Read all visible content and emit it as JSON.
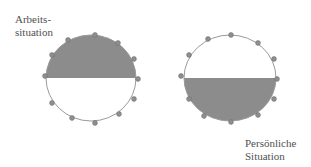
{
  "diagram": {
    "colors": {
      "background": "#ffffff",
      "fill": "#8c8c8c",
      "outline": "#9a9a9a",
      "dot_fill": "#8f8f8f",
      "dot_stroke": "#6e6e6e",
      "label": "#505050"
    },
    "circles": [
      {
        "id": "arbeitssituation",
        "label": "Arbeits-\nsituation",
        "filled_half": "top",
        "center": [
          91,
          78
        ],
        "rx": 45,
        "ry": 43,
        "dots": [
          [
            68,
            40
          ],
          [
            95,
            35
          ],
          [
            118,
            43
          ],
          [
            134,
            59
          ],
          [
            138,
            79
          ],
          [
            134,
            99
          ],
          [
            119,
            114
          ],
          [
            95,
            123
          ],
          [
            72,
            118
          ],
          [
            52,
            103
          ],
          [
            52,
            55
          ],
          [
            45,
            76
          ]
        ]
      },
      {
        "id": "persoenliche-situation",
        "label": "Persönliche\nSituation",
        "filled_half": "bottom",
        "center": [
          230,
          78
        ],
        "rx": 46,
        "ry": 43,
        "dots": [
          [
            208,
            39
          ],
          [
            231,
            35
          ],
          [
            258,
            43
          ],
          [
            274,
            59
          ],
          [
            277,
            79
          ],
          [
            274,
            99
          ],
          [
            258,
            115
          ],
          [
            231,
            122
          ],
          [
            204,
            116
          ],
          [
            189,
            99
          ],
          [
            189,
            55
          ],
          [
            181,
            76
          ]
        ]
      }
    ]
  }
}
